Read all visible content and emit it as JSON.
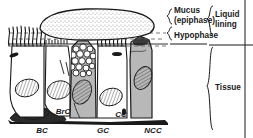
{
  "figure": {
    "background_color": "#ffffff",
    "ink_color": "#1a1a1a",
    "cell_fill_gray": "#b8b8b8",
    "cell_fill_white": "#ffffff",
    "mucus_fill": "#fdfdfd"
  },
  "layer_labels": {
    "mucus_line1": "Mucus",
    "mucus_line2": "(epiphase)",
    "hypophase": "Hypophase",
    "liquid_line1": "Liquid",
    "liquid_line2": "lining",
    "tissue": "Tissue"
  },
  "cell_labels": [
    {
      "id": "bc",
      "text": "BC",
      "x": 42,
      "y": 133,
      "meaning": "basal cell"
    },
    {
      "id": "brc",
      "text": "BrC",
      "x": 63,
      "y": 114,
      "meaning": "brush cell"
    },
    {
      "id": "gc",
      "text": "GC",
      "x": 103,
      "y": 133,
      "meaning": "goblet cell"
    },
    {
      "id": "cc",
      "text": "CC",
      "x": 121,
      "y": 117,
      "meaning": "ciliated cell"
    },
    {
      "id": "ncc",
      "text": "NCC",
      "x": 153,
      "y": 133,
      "meaning": "non-ciliated cell"
    }
  ],
  "structures": {
    "mucus_blob": "stippled dome-shaped mucus layer",
    "hypophase_band": "dashed periciliary liquid band",
    "cilia": "wavy vertical cilia tufts on ciliated cells",
    "granules": "mucus granules inside goblet cell",
    "nuclei": "hatched oval nuclei",
    "particles": "dark inhaled particles",
    "basement_membrane": "basal lamina line"
  }
}
